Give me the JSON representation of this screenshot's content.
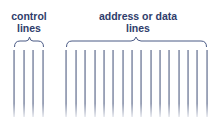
{
  "diagram": {
    "groups": [
      {
        "name": "control",
        "label_line1": "control",
        "label_line2": "lines",
        "line_count": 4,
        "line_x": [
          14,
          24,
          33,
          43
        ]
      },
      {
        "name": "address-data",
        "label_line1": "address or data",
        "label_line2": "lines",
        "line_count": 16,
        "line_x": [
          66,
          76,
          85,
          95,
          104,
          113,
          123,
          132,
          141,
          151,
          160,
          169,
          179,
          188,
          197,
          207
        ]
      }
    ],
    "colors": {
      "text": "#2f3d6b",
      "brace": "#4a5a85",
      "line": "#6c7796"
    }
  }
}
